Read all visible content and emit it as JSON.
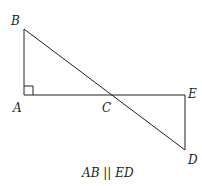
{
  "diagram": {
    "points": {
      "A": {
        "label": "A",
        "x": 24,
        "y": 95
      },
      "B": {
        "label": "B",
        "x": 24,
        "y": 29
      },
      "C": {
        "label": "C",
        "x": 112,
        "y": 95
      },
      "E": {
        "label": "E",
        "x": 185,
        "y": 95
      },
      "D": {
        "label": "D",
        "x": 185,
        "y": 150
      }
    },
    "segments": [
      "AB",
      "AE",
      "BD",
      "ED"
    ],
    "right_angle_at": "A",
    "caption": "AB || ED",
    "stroke_color": "#231f20"
  }
}
